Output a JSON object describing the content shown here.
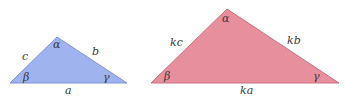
{
  "colors": {
    "small_fill": "#9fb3ee",
    "small_stroke": "#7f94d6",
    "large_fill": "#e88f9e",
    "large_stroke": "#c9707f",
    "label": "#3a3a3a"
  },
  "small_triangle": {
    "points": "10,83 57,37 127,83",
    "sides": {
      "a": "a",
      "b": "b",
      "c": "c"
    },
    "angles": {
      "alpha": "α",
      "beta": "β",
      "gamma": "γ"
    }
  },
  "large_triangle": {
    "points": "151,83 227,9 339,83",
    "sides": {
      "a": "ka",
      "b": "kb",
      "c": "kc"
    },
    "angles": {
      "alpha": "α",
      "beta": "β",
      "gamma": "γ"
    }
  }
}
